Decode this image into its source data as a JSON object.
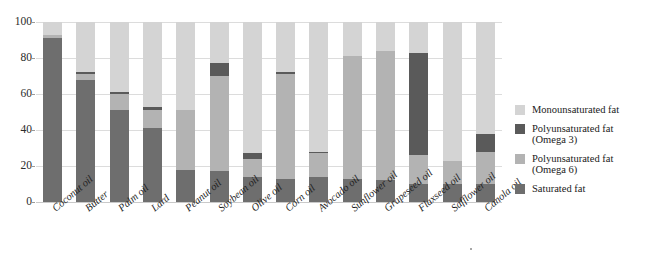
{
  "chart_data": {
    "type": "bar",
    "title": "",
    "subtitle": "",
    "xlabel": "",
    "ylabel": "",
    "ylim": [
      0,
      100
    ],
    "yticks": [
      0,
      20,
      40,
      60,
      80,
      100
    ],
    "grid": true,
    "stacked": true,
    "legend_position": "right",
    "categories": [
      "Coconut oil",
      "Butter",
      "Palm oil",
      "Lard",
      "Peanut oil",
      "Soybean oil",
      "Olive oil",
      "Corn oil",
      "Avocado oil",
      "Sunflower oil",
      "Grapeseed oil",
      "Flaxseed oil",
      "Safflower oil",
      "Canola oil"
    ],
    "series": [
      {
        "name": "Saturated fat",
        "color": "#6e6e6e",
        "values": [
          91,
          68,
          51,
          41,
          18,
          17,
          14,
          13,
          14,
          13,
          12,
          10,
          10,
          10
        ]
      },
      {
        "name": "Polyunsaturated fat (Omega 6)",
        "color": "#b3b3b3",
        "values": [
          2,
          3,
          9,
          10,
          33,
          53,
          10,
          58,
          13,
          68,
          72,
          16,
          13,
          18
        ]
      },
      {
        "name": "Polyunsaturated fat (Omega 3)",
        "color": "#5a5a5a",
        "values": [
          0,
          1,
          1,
          2,
          0,
          7,
          3,
          1,
          1,
          0,
          0,
          57,
          0,
          10
        ]
      },
      {
        "name": "Monounsaturated fat",
        "color": "#d4d4d4",
        "values": [
          7,
          28,
          39,
          47,
          49,
          23,
          73,
          28,
          72,
          19,
          16,
          17,
          77,
          62
        ]
      }
    ]
  },
  "legend": {
    "items": [
      {
        "label": "Monounsaturated fat",
        "sub": "",
        "color": "#d4d4d4"
      },
      {
        "label": "Polyunsaturated fat",
        "sub": "(Omega 3)",
        "color": "#5a5a5a"
      },
      {
        "label": "Polyunsaturated fat",
        "sub": "(Omega 6)",
        "color": "#b3b3b3"
      },
      {
        "label": "Saturated fat",
        "sub": "",
        "color": "#6e6e6e"
      }
    ]
  },
  "axis": {
    "y_tick_labels": [
      "100",
      "80",
      "60",
      "40",
      "20",
      "0"
    ]
  }
}
